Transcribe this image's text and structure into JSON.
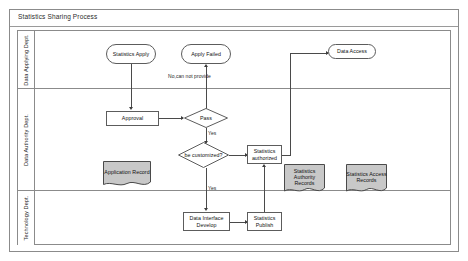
{
  "diagram": {
    "type": "flowchart",
    "title": "Statistics Sharing Process",
    "lanes": [
      {
        "id": "applying",
        "label": "Data Applying Dept."
      },
      {
        "id": "authority",
        "label": "Data Authority Dept."
      },
      {
        "id": "technology",
        "label": "Technology Dept."
      }
    ],
    "nodes": [
      {
        "id": "statistics-apply",
        "shape": "terminator",
        "lane": "applying",
        "label": "Statistics Apply"
      },
      {
        "id": "apply-failed",
        "shape": "terminator",
        "lane": "applying",
        "label": "Apply Failed"
      },
      {
        "id": "data-access",
        "shape": "terminator",
        "lane": "applying",
        "label": "Data Access"
      },
      {
        "id": "approval",
        "shape": "process",
        "lane": "authority",
        "label": "Approval"
      },
      {
        "id": "pass",
        "shape": "decision",
        "lane": "authority",
        "label": "Pass"
      },
      {
        "id": "be-customized",
        "shape": "decision",
        "lane": "authority",
        "label": "be customized?"
      },
      {
        "id": "application-record",
        "shape": "record",
        "lane": "authority",
        "label": "Application Record"
      },
      {
        "id": "statistics-authorized",
        "shape": "process",
        "lane": "authority",
        "label": "Statistics authorized"
      },
      {
        "id": "statistics-authority-records",
        "shape": "record",
        "lane": "authority",
        "label": "Statistics Authority Records"
      },
      {
        "id": "statistics-access-records",
        "shape": "record",
        "lane": "authority",
        "label": "Statistics Access Records"
      },
      {
        "id": "data-interface-develop",
        "shape": "process",
        "lane": "technology",
        "label": "Data Interface Develop"
      },
      {
        "id": "statistics-publish",
        "shape": "process",
        "lane": "technology",
        "label": "Statistics Publish"
      }
    ],
    "edges": [
      {
        "id": "apply-to-approval",
        "from": "statistics-apply",
        "to": "approval",
        "label": ""
      },
      {
        "id": "pass-to-apply-failed",
        "from": "pass",
        "to": "apply-failed",
        "label": "No,can not provide"
      },
      {
        "id": "approval-to-pass",
        "from": "approval",
        "to": "pass",
        "label": ""
      },
      {
        "id": "pass-to-be-customized",
        "from": "pass",
        "to": "be-customized",
        "label": "Yes"
      },
      {
        "id": "be-customized-to-authorized",
        "from": "be-customized",
        "to": "statistics-authorized",
        "label": ""
      },
      {
        "id": "be-customized-to-develop",
        "from": "be-customized",
        "to": "data-interface-develop",
        "label": "Yes"
      },
      {
        "id": "develop-to-publish",
        "from": "data-interface-develop",
        "to": "statistics-publish",
        "label": ""
      },
      {
        "id": "publish-to-authorized",
        "from": "statistics-publish",
        "to": "statistics-authorized",
        "label": ""
      },
      {
        "id": "authorized-to-data-access",
        "from": "statistics-authorized",
        "to": "data-access",
        "label": ""
      }
    ],
    "edge_labels": {
      "no_cannot_provide": "No,can not provide",
      "yes_pass": "Yes",
      "yes_customized": "Yes"
    },
    "colors": {
      "record_fill": "#c8c8c8",
      "line": "#4a4a4a",
      "border": "#5c5c5c",
      "frame": "#8b8b8b",
      "background": "#ffffff",
      "text": "#111111"
    }
  }
}
